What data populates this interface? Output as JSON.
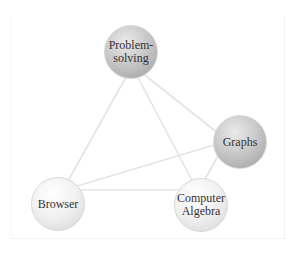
{
  "diagram": {
    "type": "concept-network",
    "nodes": [
      {
        "id": "problem-solving",
        "label_line1": "Problem-",
        "label_line2": "solving",
        "shade": "dark",
        "cx": 131,
        "cy": 52
      },
      {
        "id": "graphs",
        "label_line1": "Graphs",
        "label_line2": "",
        "shade": "dark",
        "cx": 240,
        "cy": 142
      },
      {
        "id": "browser",
        "label_line1": "Browser",
        "label_line2": "",
        "shade": "light",
        "cx": 58,
        "cy": 204
      },
      {
        "id": "computer-algebra",
        "label_line1": "Computer",
        "label_line2": "Algebra",
        "shade": "light",
        "cx": 201,
        "cy": 205
      }
    ],
    "edges": [
      {
        "from": "problem-solving",
        "to": "browser"
      },
      {
        "from": "problem-solving",
        "to": "computer-algebra"
      },
      {
        "from": "problem-solving",
        "to": "graphs"
      },
      {
        "from": "browser",
        "to": "graphs"
      },
      {
        "from": "browser",
        "to": "computer-algebra"
      },
      {
        "from": "graphs",
        "to": "computer-algebra"
      }
    ],
    "colors": {
      "line": "#e6e6e6",
      "node_border": "#d8d8d8",
      "text": "#333333"
    }
  }
}
